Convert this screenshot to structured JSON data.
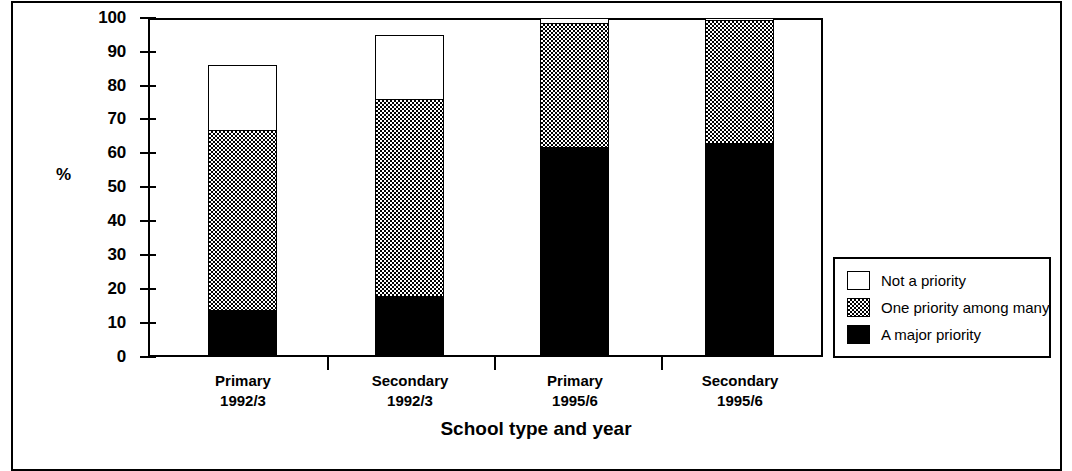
{
  "chart_data": {
    "type": "bar",
    "subtype": "stacked-vertical",
    "title": "",
    "xlabel": "School type and year",
    "ylabel": "%",
    "ylim": [
      0,
      100
    ],
    "yticks": [
      0,
      10,
      20,
      30,
      40,
      50,
      60,
      70,
      80,
      90,
      100
    ],
    "grid": false,
    "legend_position": "bottom-right-inside",
    "categories": [
      "Primary\n1992/3",
      "Secondary\n1992/3",
      "Primary\n1995/6",
      "Secondary\n1995/6"
    ],
    "series": [
      {
        "name": "A major priority",
        "values": [
          14,
          18,
          62,
          63
        ],
        "fill": "black"
      },
      {
        "name": "One priority among many",
        "values": [
          53,
          58,
          36.5,
          36.5
        ],
        "fill": "checkered-gray"
      },
      {
        "name": "Not a priority",
        "values": [
          19,
          19,
          1.5,
          0.5
        ],
        "fill": "white"
      }
    ],
    "stack_tops": [
      86,
      95,
      98.5,
      99.5
    ]
  },
  "axes": {
    "y": {
      "label": "%",
      "ticks": [
        {
          "value": 100,
          "label": "100"
        },
        {
          "value": 90,
          "label": "90"
        },
        {
          "value": 80,
          "label": "80"
        },
        {
          "value": 70,
          "label": "70"
        },
        {
          "value": 60,
          "label": "60"
        },
        {
          "value": 50,
          "label": "50"
        },
        {
          "value": 40,
          "label": "40"
        },
        {
          "value": 30,
          "label": "30"
        },
        {
          "value": 20,
          "label": "20"
        },
        {
          "value": 10,
          "label": "10"
        },
        {
          "value": 0,
          "label": "0"
        }
      ]
    },
    "x": {
      "title": "School type and year",
      "groups": [
        {
          "type": "Primary",
          "year": "1992/3"
        },
        {
          "type": "Secondary",
          "year": "1992/3"
        },
        {
          "type": "Primary",
          "year": "1995/6"
        },
        {
          "type": "Secondary",
          "year": "1995/6"
        }
      ]
    }
  },
  "legend": {
    "entries": [
      {
        "label": "Not a priority",
        "swatch": "white-square"
      },
      {
        "label": "One priority among many",
        "swatch": "checkered-square"
      },
      {
        "label": "A major priority",
        "swatch": "black-square"
      }
    ]
  },
  "colors": {
    "ink": "#000000",
    "paper": "#ffffff",
    "pattern_gray": "#808080"
  }
}
